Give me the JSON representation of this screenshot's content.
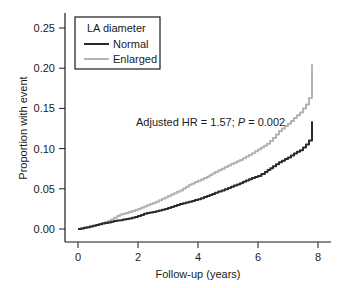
{
  "chart_data": {
    "type": "line",
    "title": "",
    "xlabel": "Follow-up (years)",
    "ylabel": "Proportion with event",
    "xlim": [
      0,
      8
    ],
    "ylim": [
      0,
      0.25
    ],
    "xticks": [
      0,
      2,
      4,
      6,
      8
    ],
    "xtick_labels": [
      "0",
      "2",
      "4",
      "6",
      "8"
    ],
    "yticks": [
      0,
      0.05,
      0.1,
      0.15,
      0.2,
      0.25
    ],
    "ytick_labels": [
      "0.00",
      "0.05",
      "0.10",
      "0.15",
      "0.20",
      "0.25"
    ],
    "grid": false,
    "legend": {
      "title": "LA diameter",
      "placement": "top-left",
      "entries": [
        "Normal",
        "Enlarged"
      ]
    },
    "annotation": {
      "prefix": "Adjusted HR = 1.57; ",
      "p_symbol": "P",
      "suffix": " = 0.002"
    },
    "series": [
      {
        "name": "Normal",
        "color": "#2b2b2b",
        "x": [
          0,
          0.4,
          0.7,
          1.0,
          1.2,
          1.4,
          1.7,
          2.0,
          2.2,
          2.6,
          3.0,
          3.4,
          3.7,
          4.0,
          4.3,
          4.57,
          5.0,
          5.4,
          5.7,
          6.0,
          6.23,
          6.5,
          6.7,
          7.0,
          7.2,
          7.4,
          7.6,
          7.7,
          7.8,
          7.8
        ],
        "values": [
          0,
          0.003,
          0.006,
          0.008,
          0.01,
          0.011,
          0.013,
          0.016,
          0.019,
          0.022,
          0.026,
          0.031,
          0.034,
          0.037,
          0.041,
          0.045,
          0.051,
          0.057,
          0.062,
          0.066,
          0.071,
          0.078,
          0.083,
          0.089,
          0.094,
          0.098,
          0.105,
          0.11,
          0.114,
          0.134
        ]
      },
      {
        "name": "Enlarged",
        "color": "#b3b3b3",
        "x": [
          0,
          0.4,
          0.7,
          1.0,
          1.2,
          1.4,
          1.7,
          2.0,
          2.2,
          2.6,
          3.0,
          3.4,
          3.7,
          4.0,
          4.3,
          4.57,
          5.0,
          5.4,
          5.7,
          6.0,
          6.3,
          6.5,
          6.7,
          7.0,
          7.2,
          7.4,
          7.6,
          7.7,
          7.8,
          7.8
        ],
        "values": [
          0,
          0.003,
          0.006,
          0.01,
          0.014,
          0.018,
          0.021,
          0.025,
          0.028,
          0.034,
          0.041,
          0.048,
          0.055,
          0.06,
          0.065,
          0.071,
          0.079,
          0.086,
          0.092,
          0.099,
          0.106,
          0.113,
          0.122,
          0.131,
          0.138,
          0.145,
          0.155,
          0.163,
          0.175,
          0.205
        ]
      }
    ]
  }
}
